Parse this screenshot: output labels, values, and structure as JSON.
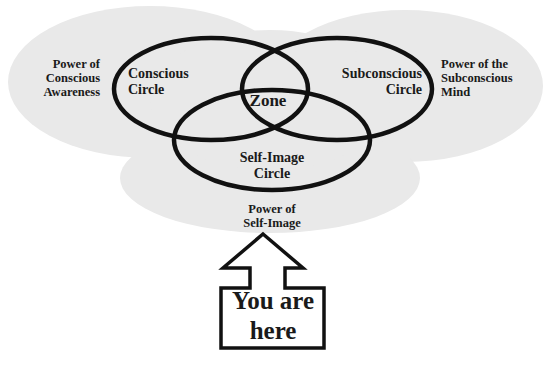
{
  "diagram": {
    "type": "venn",
    "regions": {
      "left_power": "Power of\nConscious\nAwareness",
      "right_power": "Power of the\nSubconscious\nMind",
      "bottom_power": "Power of\nSelf-Image"
    },
    "circles": {
      "conscious": "Conscious\nCircle",
      "subconscious": "Subconscious\nCircle",
      "self_image": "Self-Image\nCircle"
    },
    "center": "Zone",
    "pointer": "You are\nhere"
  },
  "colors": {
    "blob": "#e9e9e9",
    "stroke": "#111111",
    "text": "#1a1a1a"
  }
}
